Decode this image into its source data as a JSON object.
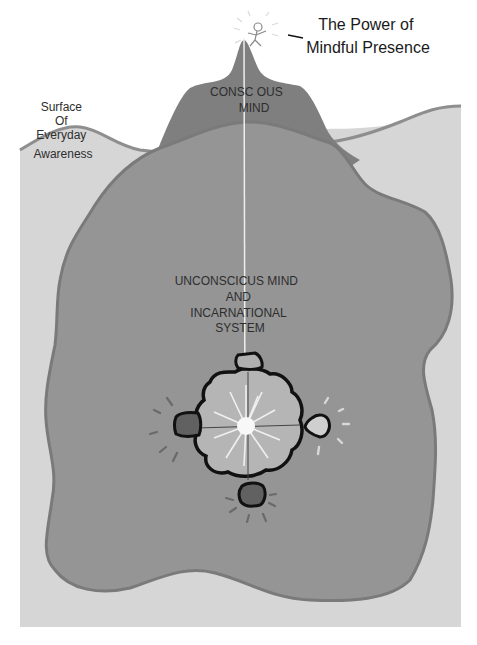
{
  "diagram": {
    "title_lines": [
      "The Power of",
      "Mindful Presence"
    ],
    "surface_label_lines": [
      "Surface",
      "Of",
      "Everyday",
      "Awareness"
    ],
    "conscious_label_lines": [
      "CONSC OUS",
      "MIND"
    ],
    "unconscious_label_lines": [
      "UNCONSCICUS MIND",
      "AND",
      "INCARNATIONAL",
      "SYSTEM"
    ],
    "figure": "stick-figure-person-on-peak",
    "core": "radiant-core-with-four-nodes",
    "colors": {
      "background": "#ffffff",
      "water": "#d6d6d6",
      "water_edge": "#8e8e8e",
      "mountain": "#7f7f7f",
      "unconscious_body": "#959595",
      "unconscious_edge": "#7a7a7a",
      "core_fill": "#b5b5b5",
      "core_outline": "#111111",
      "core_glow": "#f4f4f4",
      "node_dark": "#616161",
      "node_light": "#cfcfcf"
    }
  }
}
